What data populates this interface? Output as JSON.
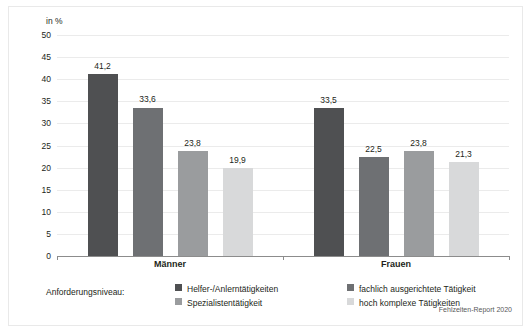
{
  "chart_data": {
    "type": "bar",
    "title": "",
    "xlabel": "",
    "ylabel": "in %",
    "unit_label": "in %",
    "ylim": [
      0,
      50
    ],
    "ytick_step": 5,
    "yticks": [
      50,
      45,
      40,
      35,
      30,
      25,
      20,
      15,
      10,
      5,
      0
    ],
    "ytick_labels": [
      "50",
      "45",
      "40",
      "35",
      "30",
      "25",
      "20",
      "15",
      "10",
      "5",
      "0"
    ],
    "grid": true,
    "legend_position": "bottom",
    "legend_title": "Anforderungsniveau:",
    "categories": [
      "Männer",
      "Frauen"
    ],
    "series": [
      {
        "name": "Helfer-/Anlerntätigkeiten",
        "color": "#4f5052",
        "values": [
          41.2,
          33.5
        ],
        "labels": [
          "41,2",
          "33,5"
        ]
      },
      {
        "name": "fachlich ausgerichtete Tätigkeit",
        "color": "#6e7073",
        "values": [
          33.6,
          22.5
        ],
        "labels": [
          "33,6",
          "22,5"
        ]
      },
      {
        "name": "Spezialistentätigkeit",
        "color": "#9a9c9e",
        "values": [
          23.8,
          23.8
        ],
        "labels": [
          "23,8",
          "23,8"
        ]
      },
      {
        "name": "hoch komplexe Tätigkeiten",
        "color": "#d8d9da",
        "values": [
          19.9,
          21.3
        ],
        "labels": [
          "19,9",
          "21,3"
        ]
      }
    ],
    "source": "Fehlzeiten-Report 2020",
    "colors": {
      "gridline": "#ebebeb",
      "axis": "#8c8c8c",
      "text": "#231f20",
      "background": "#ffffff",
      "frame": "#e9e9e9"
    }
  }
}
